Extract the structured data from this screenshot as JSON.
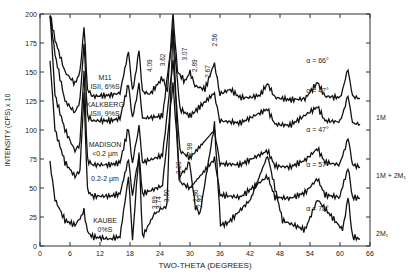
{
  "chart_data": {
    "type": "line",
    "title": "",
    "xlabel": "TWO-THETA (DEGREES)",
    "ylabel": "INTENSITY (CPS) x 10",
    "xlim": [
      0,
      66
    ],
    "ylim": [
      0,
      200
    ],
    "xticks": [
      0,
      6,
      12,
      18,
      24,
      30,
      36,
      42,
      48,
      54,
      60,
      66
    ],
    "yticks": [
      0,
      25,
      50,
      75,
      100,
      125,
      150,
      175,
      200
    ],
    "grid": false,
    "series": [
      {
        "name": "M11 ISII, 6%S",
        "label_lines": [
          "M11",
          "ISII, 6%S"
        ],
        "alpha_label": "α = 66°",
        "baseline": 130,
        "x": [
          2,
          3,
          5,
          7,
          8,
          8.8,
          9.5,
          10.5,
          14,
          16,
          17.7,
          18.5,
          19.8,
          20.5,
          22,
          24.5,
          25.5,
          26.6,
          27.5,
          29,
          30,
          31,
          33,
          34.9,
          36,
          38,
          40,
          42,
          44,
          45.5,
          47,
          50,
          53,
          55.5,
          57,
          60,
          61.6,
          62.5,
          64
        ],
        "y": [
          200,
          178,
          150,
          140,
          150,
          190,
          135,
          129,
          130,
          132,
          168,
          132,
          168,
          133,
          131,
          145,
          133,
          200,
          150,
          142,
          150,
          138,
          135,
          158,
          131,
          135,
          128,
          128,
          130,
          140,
          128,
          126,
          127,
          141,
          129,
          128,
          152,
          129,
          127
        ]
      },
      {
        "name": "KALKBERG ISII, 9%S",
        "label_lines": [
          "KALKBERG",
          "ISII, 9%S"
        ],
        "alpha_label": "α = 47°",
        "baseline": 108,
        "x": [
          2,
          3,
          5,
          7,
          8,
          8.8,
          9.5,
          10.5,
          14,
          16,
          17.7,
          18.5,
          19.8,
          20.5,
          24.5,
          26.6,
          28,
          30,
          34.9,
          36,
          40,
          45.5,
          47,
          50,
          55.5,
          57,
          60,
          61.6,
          62.5,
          64
        ],
        "y": [
          200,
          165,
          125,
          115,
          125,
          175,
          112,
          108,
          108,
          110,
          140,
          109,
          140,
          110,
          112,
          185,
          118,
          112,
          132,
          108,
          106,
          118,
          105,
          104,
          120,
          108,
          107,
          130,
          106,
          105
        ]
      },
      {
        "name": "MADISON <0.2 µm",
        "label_lines": [
          "MADISON",
          "<0.2 µm"
        ],
        "alpha_label": "α = 47°",
        "baseline": 70,
        "x": [
          2,
          3,
          5,
          7,
          8,
          8.8,
          9.5,
          10.5,
          14,
          16,
          17.7,
          18.5,
          19.8,
          20.5,
          24.5,
          26.6,
          28,
          30,
          34.9,
          36,
          40,
          45.5,
          47,
          50,
          53,
          55.5,
          57,
          60,
          61.6,
          62.5,
          64
        ],
        "y": [
          200,
          130,
          100,
          82,
          88,
          150,
          74,
          70,
          70,
          72,
          102,
          71,
          104,
          72,
          78,
          160,
          82,
          76,
          100,
          71,
          70,
          82,
          69,
          68,
          74,
          84,
          72,
          70,
          94,
          70,
          68
        ]
      },
      {
        "name": "0.2-2 µm",
        "label_lines": [
          "0.2-2 µm"
        ],
        "alpha_label": "α = 57°",
        "baseline": 43,
        "x": [
          2,
          3,
          5,
          7,
          8,
          8.8,
          9.5,
          10.5,
          14,
          16,
          17.7,
          18.5,
          19.8,
          20.5,
          24.5,
          26.6,
          28,
          30,
          34.9,
          36,
          40,
          45.5,
          47,
          50,
          53,
          55.5,
          57,
          60,
          61.6,
          62.5,
          64
        ],
        "y": [
          160,
          100,
          72,
          60,
          65,
          130,
          48,
          43,
          43,
          45,
          75,
          44,
          78,
          45,
          52,
          140,
          55,
          50,
          75,
          44,
          42,
          60,
          42,
          41,
          46,
          58,
          44,
          42,
          68,
          42,
          41
        ]
      },
      {
        "name": "KAUBE 0%S",
        "label_lines": [
          "KAUBE",
          "0%S"
        ],
        "alpha_label": "α = 78°",
        "baseline": 7,
        "x": [
          2,
          3,
          5,
          7,
          8,
          8.8,
          9.5,
          10.5,
          14,
          16,
          17.7,
          18.5,
          19.8,
          20.5,
          22.9,
          23.8,
          25.4,
          26.6,
          27.8,
          29.9,
          31.1,
          32.0,
          34.9,
          36.1,
          37.6,
          42.1,
          45.5,
          48.5,
          53,
          55.5,
          60.5,
          61.6,
          62.5,
          64
        ],
        "y": [
          72,
          40,
          22,
          18,
          24,
          30,
          12,
          8,
          6,
          8,
          60,
          6,
          80,
          8,
          28,
          30,
          36,
          190,
          58,
          72,
          33,
          28,
          105,
          18,
          20,
          40,
          78,
          22,
          14,
          40,
          14,
          42,
          8,
          6
        ]
      }
    ],
    "peak_annotations_upper": [
      {
        "d": "4.09",
        "x": 22.0
      },
      {
        "d": "3.62",
        "x": 24.5
      },
      {
        "d": "3.07",
        "x": 29.0
      },
      {
        "d": "2.89",
        "x": 30.9
      },
      {
        "d": "2.67",
        "x": 33.5
      },
      {
        "d": "2.56",
        "x": 34.9
      }
    ],
    "peak_annotations_lower": [
      {
        "d": "3.89",
        "x": 22.9
      },
      {
        "d": "3.74",
        "x": 23.8
      },
      {
        "d": "3.50",
        "x": 25.4
      },
      {
        "d": "3.20",
        "x": 27.8
      },
      {
        "d": "2.98",
        "x": 29.9
      },
      {
        "d": "2.86",
        "x": 31.1
      },
      {
        "d": "2.80",
        "x": 32.0
      }
    ],
    "polytype_labels": [
      {
        "text": "1M",
        "y": 110
      },
      {
        "text": "1M + 2M₁",
        "y": 60
      },
      {
        "text": "2M₁",
        "y": 10
      }
    ]
  }
}
